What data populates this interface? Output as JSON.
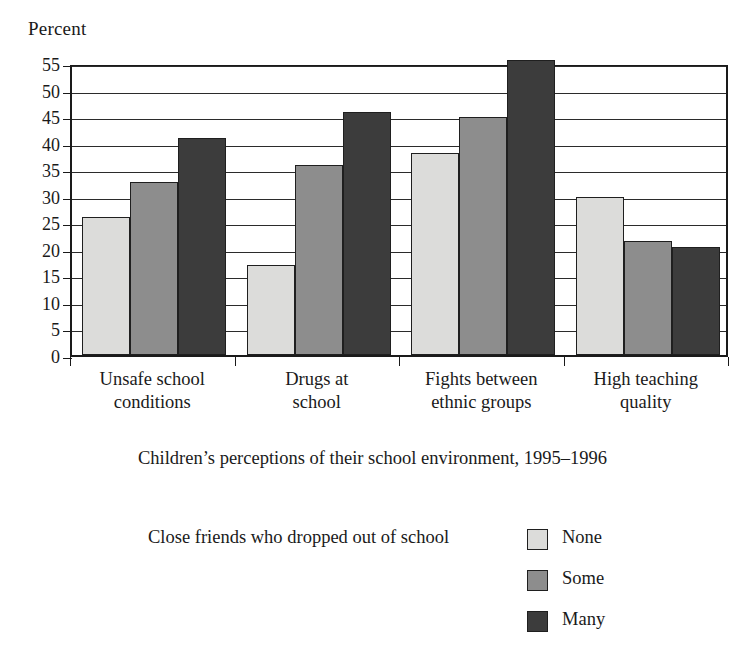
{
  "axis_title": "Percent",
  "caption": "Children’s perceptions of their school environment, 1995–1996",
  "legend": {
    "title": "Close friends who dropped out of school",
    "items": [
      {
        "label": "None",
        "color": "#dcdcda"
      },
      {
        "label": "Some",
        "color": "#8d8d8d"
      },
      {
        "label": "Many",
        "color": "#3c3c3c"
      }
    ]
  },
  "yticks": [
    "55",
    "50",
    "45",
    "40",
    "35",
    "30",
    "25",
    "20",
    "15",
    "10",
    "5",
    "0"
  ],
  "categories_display": [
    {
      "line1": "Unsafe school",
      "line2": "conditions"
    },
    {
      "line1": "Drugs at",
      "line2": "school"
    },
    {
      "line1": "Fights between",
      "line2": "ethnic groups"
    },
    {
      "line1": "High teaching",
      "line2": "quality"
    }
  ],
  "chart_data": {
    "type": "bar",
    "title": "Children’s perceptions of their school environment, 1995–1996",
    "xlabel": "",
    "ylabel": "Percent",
    "ylim": [
      0,
      55
    ],
    "ytick_step": 5,
    "grid": true,
    "legend_position": "right-below",
    "legend_title": "Close friends who dropped out of school",
    "categories": [
      "Unsafe school conditions",
      "Drugs at school",
      "Fights between ethnic groups",
      "High teaching quality"
    ],
    "series": [
      {
        "name": "None",
        "color": "#dcdcda",
        "values": [
          26.0,
          17.0,
          38.0,
          29.7
        ]
      },
      {
        "name": "Some",
        "color": "#8d8d8d",
        "values": [
          32.5,
          35.8,
          44.8,
          21.5
        ]
      },
      {
        "name": "Many",
        "color": "#3c3c3c",
        "values": [
          40.8,
          45.8,
          55.5,
          20.3
        ]
      }
    ]
  }
}
